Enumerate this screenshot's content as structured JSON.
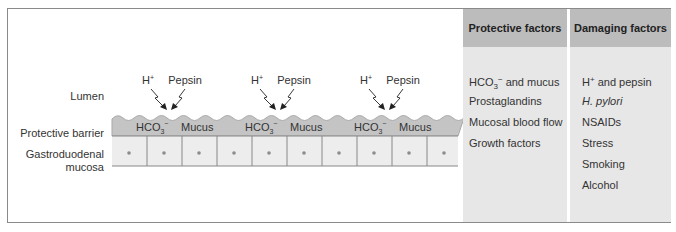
{
  "diagram": {
    "labels": {
      "lumen": "Lumen",
      "protective_barrier": "Protective barrier",
      "mucosa_line1": "Gastroduodenal",
      "mucosa_line2": "mucosa"
    },
    "attack_groups": [
      {
        "acid": "H",
        "acid_charge": "+",
        "enzyme": "Pepsin",
        "barrier_ion": "HCO",
        "barrier_ion_sub": "3",
        "barrier_ion_charge": "−",
        "barrier_mucus": "Mucus"
      },
      {
        "acid": "H",
        "acid_charge": "+",
        "enzyme": "Pepsin",
        "barrier_ion": "HCO",
        "barrier_ion_sub": "3",
        "barrier_ion_charge": "−",
        "barrier_mucus": "Mucus"
      },
      {
        "acid": "H",
        "acid_charge": "+",
        "enzyme": "Pepsin",
        "barrier_ion": "HCO",
        "barrier_ion_sub": "3",
        "barrier_ion_charge": "−",
        "barrier_mucus": "Mucus"
      }
    ],
    "colors": {
      "barrier": "#c4c4c4",
      "barrier_edge": "#a9a9a9",
      "cell_fill": "#ededed",
      "cell_border": "#888888",
      "nucleus": "#8c8c8c",
      "arrow": "#222222"
    }
  },
  "table": {
    "protective": {
      "header": "Protective factors",
      "items": [
        {
          "text": "HCO",
          "sub": "3",
          "sup": "−",
          "rest": " and mucus"
        },
        {
          "text": "Prostaglandins"
        },
        {
          "text": "Mucosal blood flow"
        },
        {
          "text": "Growth factors"
        }
      ]
    },
    "damaging": {
      "header": "Damaging factors",
      "items": [
        {
          "text": "H",
          "sup": "+",
          "rest": " and pepsin"
        },
        {
          "text": "H. pylori",
          "italic": true
        },
        {
          "text": "NSAIDs"
        },
        {
          "text": "Stress"
        },
        {
          "text": "Smoking"
        },
        {
          "text": "Alcohol"
        }
      ]
    },
    "colors": {
      "header_bg": "#bcbcbc",
      "body_bg": "#e7e7e7"
    }
  }
}
